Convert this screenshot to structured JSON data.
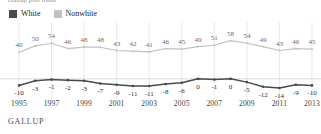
{
  "title": {
    "clipped_text": "Gallup poll trend"
  },
  "legend": {
    "position": "top-left",
    "items": [
      {
        "label": "White",
        "color": "#4a4a4a",
        "icon": "square-swatch"
      },
      {
        "label": "Nonwhite",
        "color": "#c2c2c2",
        "icon": "square-swatch"
      }
    ]
  },
  "source": {
    "label": "GALLUP"
  },
  "chart_data": {
    "type": "line",
    "title": "",
    "subtitle": "",
    "xlabel": "",
    "ylabel": "",
    "x": [
      1995,
      1996,
      1997,
      1998,
      1999,
      2000,
      2001,
      2002,
      2003,
      2004,
      2005,
      2006,
      2007,
      2008,
      2009,
      2010,
      2011,
      2012,
      2013
    ],
    "tick_labels": [
      "1995",
      "1997",
      "1999",
      "2001",
      "2003",
      "2005",
      "2007",
      "2009",
      "2011",
      "2013"
    ],
    "tick_values": [
      1995,
      1997,
      1999,
      2001,
      2003,
      2005,
      2007,
      2009,
      2011,
      2013
    ],
    "ylim": [
      -20,
      62
    ],
    "grid": "vertical-at-odd-years-plus-zero-line",
    "zero_line": 0,
    "legend_position": "top-left",
    "series": [
      {
        "name": "Nonwhite",
        "color": "#c2c2c2",
        "values": [
          40,
          50,
          54,
          46,
          48,
          48,
          43,
          42,
          41,
          46,
          45,
          49,
          51,
          58,
          54,
          49,
          43,
          46,
          45
        ],
        "labels": [
          "40",
          "50",
          "54",
          "46",
          "48",
          "48",
          "43",
          "42",
          "41",
          "46",
          "45",
          "49",
          "51",
          "58",
          "54",
          "49",
          "43",
          "46",
          "45"
        ]
      },
      {
        "name": "White",
        "color": "#4a4a4a",
        "values": [
          -10,
          -3,
          -1,
          -2,
          -3,
          -7,
          -9,
          -11,
          -11,
          -8,
          -6,
          0,
          -1,
          0,
          -5,
          -12,
          -14,
          -9,
          -10
        ],
        "labels": [
          "-10",
          "-3",
          "-1",
          "-2",
          "-3",
          "-7",
          "-9",
          "-11",
          "-11",
          "-8",
          "-6",
          "0",
          "-1",
          "0",
          "-5",
          "-12",
          "-14",
          "-9",
          "-10"
        ]
      }
    ]
  }
}
